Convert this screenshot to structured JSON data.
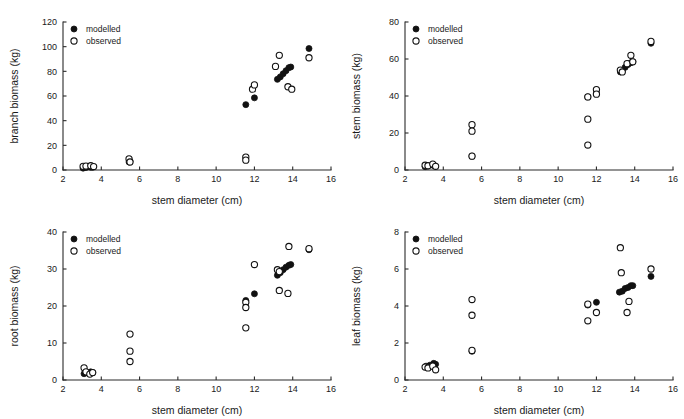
{
  "figure": {
    "panel_count": 4,
    "series_names": [
      "modelled",
      "observed"
    ],
    "marker_modelled": "filled-circle",
    "marker_observed": "open-circle",
    "marker_color": "#111111",
    "background_color": "#ffffff"
  },
  "legend": {
    "modelled_label": "modelled",
    "observed_label": "observed"
  },
  "panels": [
    {
      "key": "branch",
      "ylabel": "branch biomass (kg)",
      "xlabel": "stem diameter (cm)"
    },
    {
      "key": "stem",
      "ylabel": "stem biomass (kg)",
      "xlabel": "stem diameter (cm)"
    },
    {
      "key": "root",
      "ylabel": "root biomass (kg)",
      "xlabel": "stem diameter (cm)"
    },
    {
      "key": "leaf",
      "ylabel": "leaf biomass (kg)",
      "xlabel": "stem diameter (cm)"
    }
  ],
  "chart_data": [
    {
      "type": "scatter",
      "title": "",
      "xlabel": "stem diameter (cm)",
      "ylabel": "branch biomass (kg)",
      "xlim": [
        2,
        16
      ],
      "ylim": [
        0,
        120
      ],
      "xticks": [
        2,
        4,
        6,
        8,
        10,
        12,
        14,
        16
      ],
      "yticks": [
        0,
        20,
        40,
        60,
        80,
        100,
        120
      ],
      "grid": false,
      "legend_position": "top-left",
      "series": [
        {
          "name": "modelled",
          "marker": "filled-circle",
          "points": [
            [
              3.05,
              1.5
            ],
            [
              3.2,
              2.0
            ],
            [
              3.45,
              2.2
            ],
            [
              3.55,
              2.3
            ],
            [
              5.45,
              6.5
            ],
            [
              5.5,
              7.0
            ],
            [
              11.55,
              53.0
            ],
            [
              12.0,
              58.5
            ],
            [
              13.2,
              73.5
            ],
            [
              13.35,
              75.5
            ],
            [
              13.5,
              78.0
            ],
            [
              13.65,
              80.5
            ],
            [
              13.8,
              83.0
            ],
            [
              13.9,
              83.5
            ],
            [
              14.85,
              98.5
            ]
          ]
        },
        {
          "name": "observed",
          "marker": "open-circle",
          "points": [
            [
              3.05,
              3.0
            ],
            [
              3.2,
              3.2
            ],
            [
              3.45,
              3.5
            ],
            [
              3.6,
              2.8
            ],
            [
              5.45,
              9.0
            ],
            [
              5.5,
              6.5
            ],
            [
              11.55,
              10.5
            ],
            [
              11.55,
              8.0
            ],
            [
              11.9,
              65.5
            ],
            [
              12.0,
              69.0
            ],
            [
              13.1,
              84.0
            ],
            [
              13.3,
              93.0
            ],
            [
              13.75,
              67.5
            ],
            [
              13.95,
              65.5
            ],
            [
              14.85,
              91.0
            ]
          ]
        }
      ]
    },
    {
      "type": "scatter",
      "title": "",
      "xlabel": "stem diameter (cm)",
      "ylabel": "stem biomass (kg)",
      "xlim": [
        2,
        16
      ],
      "ylim": [
        0,
        80
      ],
      "xticks": [
        2,
        4,
        6,
        8,
        10,
        12,
        14,
        16
      ],
      "yticks": [
        0,
        20,
        40,
        60,
        80
      ],
      "grid": false,
      "legend_position": "top-left",
      "series": [
        {
          "name": "modelled",
          "marker": "filled-circle",
          "points": [
            [
              3.05,
              1.8
            ],
            [
              3.2,
              2.2
            ],
            [
              3.45,
              2.6
            ],
            [
              3.55,
              2.3
            ],
            [
              5.5,
              7.5
            ],
            [
              11.55,
              39.5
            ],
            [
              12.0,
              41.5
            ],
            [
              13.25,
              53.0
            ],
            [
              13.35,
              53.5
            ],
            [
              13.5,
              55.5
            ],
            [
              13.65,
              57.0
            ],
            [
              13.8,
              58.0
            ],
            [
              13.9,
              58.5
            ],
            [
              14.85,
              68.5
            ]
          ]
        },
        {
          "name": "observed",
          "marker": "open-circle",
          "points": [
            [
              3.05,
              2.6
            ],
            [
              3.2,
              2.3
            ],
            [
              3.45,
              3.2
            ],
            [
              3.6,
              2.0
            ],
            [
              5.5,
              24.5
            ],
            [
              5.5,
              21.0
            ],
            [
              5.5,
              7.5
            ],
            [
              11.55,
              39.5
            ],
            [
              11.55,
              27.5
            ],
            [
              11.55,
              13.5
            ],
            [
              12.0,
              43.5
            ],
            [
              12.0,
              41.0
            ],
            [
              13.25,
              54.0
            ],
            [
              13.35,
              53.0
            ],
            [
              13.6,
              57.5
            ],
            [
              13.8,
              62.0
            ],
            [
              13.9,
              58.5
            ],
            [
              14.85,
              69.5
            ]
          ]
        }
      ]
    },
    {
      "type": "scatter",
      "title": "",
      "xlabel": "stem diameter (cm)",
      "ylabel": "root biomass (kg)",
      "xlim": [
        2,
        16
      ],
      "ylim": [
        0,
        40
      ],
      "xticks": [
        2,
        4,
        6,
        8,
        10,
        12,
        14,
        16
      ],
      "yticks": [
        0,
        10,
        20,
        30,
        40
      ],
      "grid": false,
      "legend_position": "top-left",
      "series": [
        {
          "name": "modelled",
          "marker": "filled-circle",
          "points": [
            [
              3.1,
              1.7
            ],
            [
              3.25,
              2.0
            ],
            [
              3.45,
              2.2
            ],
            [
              3.55,
              2.0
            ],
            [
              11.55,
              21.5
            ],
            [
              12.0,
              23.3
            ],
            [
              13.2,
              28.3
            ],
            [
              13.35,
              29.0
            ],
            [
              13.5,
              29.8
            ],
            [
              13.65,
              30.5
            ],
            [
              13.8,
              31.0
            ],
            [
              13.9,
              31.2
            ],
            [
              14.85,
              35.2
            ]
          ]
        },
        {
          "name": "observed",
          "marker": "open-circle",
          "points": [
            [
              3.1,
              3.3
            ],
            [
              3.2,
              2.2
            ],
            [
              3.4,
              1.6
            ],
            [
              3.55,
              2.0
            ],
            [
              5.5,
              12.4
            ],
            [
              5.5,
              7.8
            ],
            [
              5.5,
              5.0
            ],
            [
              11.55,
              21.0
            ],
            [
              11.55,
              19.6
            ],
            [
              11.55,
              14.1
            ],
            [
              12.0,
              31.2
            ],
            [
              13.2,
              29.8
            ],
            [
              13.3,
              29.3
            ],
            [
              13.3,
              24.2
            ],
            [
              13.75,
              23.4
            ],
            [
              13.8,
              36.1
            ],
            [
              14.85,
              35.5
            ]
          ]
        }
      ]
    },
    {
      "type": "scatter",
      "title": "",
      "xlabel": "stem diameter (cm)",
      "ylabel": "leaf biomass (kg)",
      "xlim": [
        2,
        16
      ],
      "ylim": [
        0,
        8
      ],
      "xticks": [
        2,
        4,
        6,
        8,
        10,
        12,
        14,
        16
      ],
      "yticks": [
        0,
        2,
        4,
        6,
        8
      ],
      "grid": false,
      "legend_position": "top-left",
      "series": [
        {
          "name": "modelled",
          "marker": "filled-circle",
          "points": [
            [
              3.1,
              0.75
            ],
            [
              3.3,
              0.8
            ],
            [
              3.5,
              0.9
            ],
            [
              3.6,
              0.85
            ],
            [
              5.5,
              1.55
            ],
            [
              11.55,
              4.05
            ],
            [
              12.0,
              4.2
            ],
            [
              13.2,
              4.75
            ],
            [
              13.35,
              4.8
            ],
            [
              13.5,
              4.95
            ],
            [
              13.65,
              5.0
            ],
            [
              13.8,
              5.1
            ],
            [
              13.9,
              5.1
            ],
            [
              14.85,
              5.6
            ]
          ]
        },
        {
          "name": "observed",
          "marker": "open-circle",
          "points": [
            [
              3.05,
              0.7
            ],
            [
              3.2,
              0.65
            ],
            [
              3.45,
              0.75
            ],
            [
              3.6,
              0.55
            ],
            [
              5.5,
              4.35
            ],
            [
              5.5,
              3.5
            ],
            [
              5.5,
              1.6
            ],
            [
              11.55,
              4.1
            ],
            [
              11.55,
              3.2
            ],
            [
              12.0,
              3.65
            ],
            [
              13.25,
              7.15
            ],
            [
              13.3,
              5.8
            ],
            [
              13.7,
              4.25
            ],
            [
              13.6,
              3.65
            ],
            [
              14.85,
              6.0
            ]
          ]
        }
      ]
    }
  ]
}
